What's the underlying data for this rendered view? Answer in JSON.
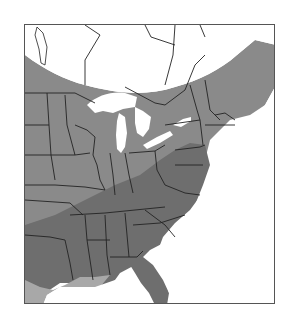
{
  "map": {
    "type": "range-map",
    "region": "Eastern United States and southeastern Canada",
    "colors": {
      "background": "#ffffff",
      "water": "#ffffff",
      "range_primary": "#6e6e6e",
      "range_secondary": "#8a8a8a",
      "range_light": "#a8a8a8",
      "borders": "#222222",
      "frame": "#555555"
    },
    "labels": []
  }
}
